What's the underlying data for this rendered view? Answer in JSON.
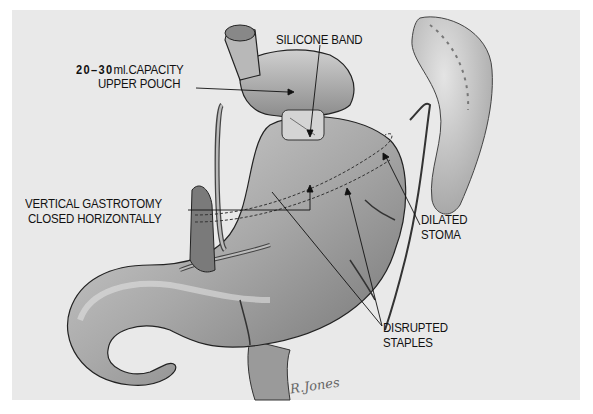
{
  "figure": {
    "type": "medical-illustration",
    "colors": {
      "background": "#e9e9e9",
      "outer": "#ffffff",
      "ink": "#111111"
    },
    "labels": {
      "pouch": {
        "capacity": "20–30",
        "unit": "ml.CAPACITY",
        "line2": "UPPER POUCH"
      },
      "band": {
        "line1": "SILICONE BAND"
      },
      "gastrotomy": {
        "line1": "VERTICAL GASTROTOMY",
        "line2": "CLOSED HORIZONTALLY"
      },
      "stoma": {
        "line1": "DILATED",
        "line2": "STOMA"
      },
      "staples": {
        "line1": "DISRUPTED",
        "line2": "STAPLES"
      }
    },
    "signature": "R.Jones"
  }
}
